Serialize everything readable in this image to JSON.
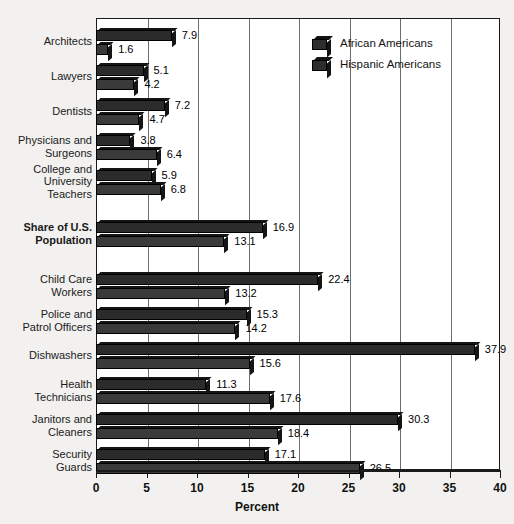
{
  "chart_data": {
    "type": "bar",
    "orientation": "horizontal",
    "title": "",
    "xlabel": "Percent",
    "ylabel": "",
    "xlim": [
      0,
      40
    ],
    "xticks": [
      0,
      5,
      10,
      15,
      20,
      25,
      30,
      35,
      40
    ],
    "xtick_labels": [
      "0",
      "5",
      "10",
      "15",
      "20",
      "25",
      "30",
      "35",
      "40"
    ],
    "grid": true,
    "grid_axis": "x",
    "legend_position": "top-right",
    "categories": [
      "Architects",
      "Lawyers",
      "Dentists",
      "Physicians and Surgeons",
      "College and University Teachers",
      "Share of U.S. Population",
      "Child Care Workers",
      "Police and Patrol Officers",
      "Dishwashers",
      "Health Technicians",
      "Janitors and Cleaners",
      "Security Guards"
    ],
    "series": [
      {
        "name": "African Americans",
        "color": "#2b2b2b",
        "values": [
          7.9,
          5.1,
          7.2,
          3.8,
          5.9,
          16.9,
          22.4,
          15.3,
          37.9,
          11.3,
          30.3,
          17.1
        ]
      },
      {
        "name": "Hispanic Americans",
        "color": "#3a3a3a",
        "values": [
          1.6,
          4.2,
          4.7,
          6.4,
          6.8,
          13.1,
          13.2,
          14.2,
          15.6,
          17.6,
          18.4,
          26.5
        ]
      }
    ]
  },
  "category_lines": [
    [
      "Architects"
    ],
    [
      "Lawyers"
    ],
    [
      "Dentists"
    ],
    [
      "Physicians and",
      "Surgeons"
    ],
    [
      "College and",
      "University",
      "Teachers"
    ],
    [
      "Share of U.S.",
      "Population"
    ],
    [
      "Child Care",
      "Workers"
    ],
    [
      "Police and",
      "Patrol Officers"
    ],
    [
      "Dishwashers"
    ],
    [
      "Health",
      "Technicians"
    ],
    [
      "Janitors and",
      "Cleaners"
    ],
    [
      "Security",
      "Guards"
    ]
  ],
  "emphasized_category": "Share of U.S. Population",
  "legend": {
    "items": [
      {
        "label": "African Americans",
        "swatch": "legend-swatch-african-americans"
      },
      {
        "label": "Hispanic Americans",
        "swatch": "legend-swatch-hispanic-americans"
      }
    ]
  },
  "axis": {
    "title": "Percent"
  },
  "colors": {
    "series1": "#2b2b2b",
    "series2": "#3a3a3a",
    "grid": "#6d6d6d",
    "frame": "#1a1a1a",
    "background": "#f2f1ef",
    "plot_background": "#ffffff"
  }
}
